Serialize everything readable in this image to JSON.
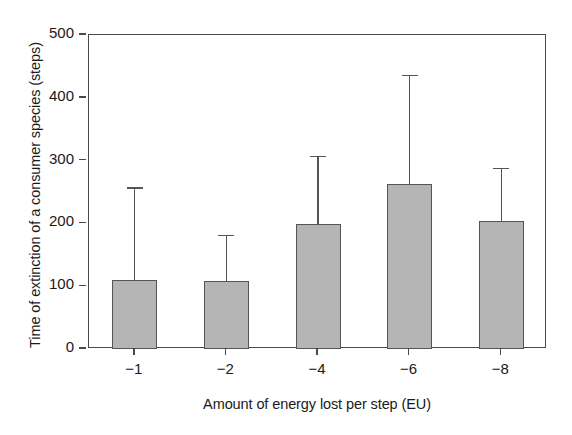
{
  "chart_data": {
    "type": "bar",
    "title": "",
    "xlabel": "Amount of energy lost per step (EU)",
    "ylabel": "Time of extinction of a consumer species (steps)",
    "categories": [
      "−1",
      "−2",
      "−4",
      "−6",
      "−8"
    ],
    "values": [
      110,
      108,
      199,
      263,
      204
    ],
    "error_upper": [
      258,
      182,
      308,
      437,
      289
    ],
    "error_type": "upper-only",
    "ylim": [
      0,
      500
    ],
    "yticks": [
      0,
      100,
      200,
      300,
      400,
      500
    ],
    "ytick_labels": [
      "0",
      "100",
      "200",
      "300",
      "400",
      "500"
    ],
    "grid": false,
    "legend": "none",
    "bar_color": "#b5b5b5",
    "bar_edge_color": "#555555",
    "axis_color": "#4a4a4a",
    "background": "#ffffff"
  }
}
